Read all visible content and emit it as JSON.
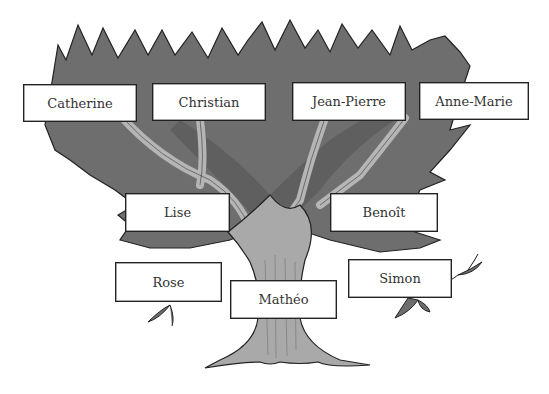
{
  "tree": {
    "colors": {
      "foliage": "#6e6e6e",
      "foliage_dark": "#555555",
      "trunk": "#a9a9a9",
      "outline": "#222222",
      "box_bg": "#ffffff",
      "text": "#333333"
    },
    "generations": {
      "grandparents": [
        {
          "name": "Catherine"
        },
        {
          "name": "Christian"
        },
        {
          "name": "Jean-Pierre"
        },
        {
          "name": "Anne-Marie"
        }
      ],
      "parents": [
        {
          "name": "Lise"
        },
        {
          "name": "Benoît"
        }
      ],
      "children": [
        {
          "name": "Rose"
        },
        {
          "name": "Mathéo"
        },
        {
          "name": "Simon"
        }
      ]
    }
  }
}
